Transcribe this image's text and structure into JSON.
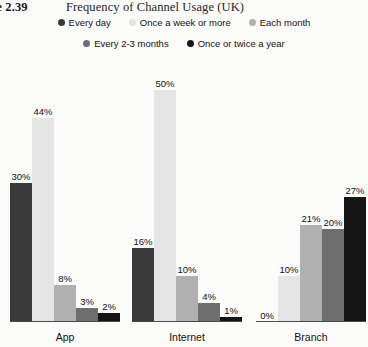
{
  "figure": {
    "number": "ure 2.39",
    "title": "Frequency of Channel Usage (UK)"
  },
  "chart_data": {
    "type": "bar",
    "title": "Frequency of Channel Usage (UK)",
    "xlabel": "",
    "ylabel": "",
    "ylim": [
      0,
      50
    ],
    "grid": false,
    "legend_position": "top",
    "value_suffix": "%",
    "categories": [
      "App",
      "Internet",
      "Branch"
    ],
    "series": [
      {
        "name": "Every day",
        "color": "#3a3a3a",
        "values": [
          30,
          16,
          0
        ],
        "labels": [
          "30%",
          "16%",
          "0%"
        ]
      },
      {
        "name": "Once a week or more",
        "color": "#e4e4e4",
        "values": [
          44,
          50,
          10
        ],
        "labels": [
          "44%",
          "50%",
          "10%"
        ]
      },
      {
        "name": "Each month",
        "color": "#b0b0b0",
        "values": [
          8,
          10,
          21
        ],
        "labels": [
          "8%",
          "10%",
          "21%"
        ]
      },
      {
        "name": "Every 2-3 months",
        "color": "#6e6e6e",
        "values": [
          3,
          4,
          20
        ],
        "labels": [
          "3%",
          "4%",
          "20%"
        ]
      },
      {
        "name": "Once or twice a year",
        "color": "#151515",
        "values": [
          2,
          1,
          27
        ],
        "labels": [
          "2%",
          "1%",
          "27%"
        ]
      }
    ]
  },
  "legend": {
    "rows": [
      [
        {
          "label": "Every day",
          "color": "#3a3a3a"
        },
        {
          "label": "Once a week or more",
          "color": "#e4e4e4"
        },
        {
          "label": "Each month",
          "color": "#b0b0b0"
        }
      ],
      [
        {
          "label": "Every 2-3 months",
          "color": "#6e6e6e"
        },
        {
          "label": "Once or twice a year",
          "color": "#151515"
        }
      ]
    ]
  },
  "groups": [
    {
      "label": "App",
      "left": 10,
      "width": 110
    },
    {
      "label": "Internet",
      "left": 132,
      "width": 110
    },
    {
      "label": "Branch",
      "left": 256,
      "width": 110
    }
  ],
  "scale": {
    "px_per_unit": 4.64,
    "max_value": 50
  }
}
